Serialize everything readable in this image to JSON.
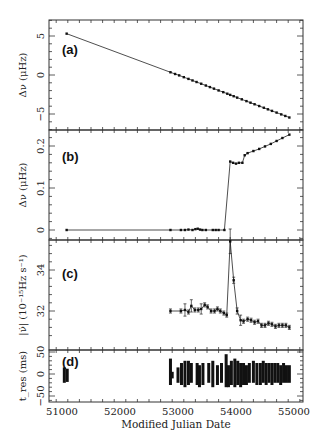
{
  "chart_data": [
    {
      "panel": "a",
      "type": "line",
      "panel_label": "(a)",
      "ylabel": "Δν (μHz)",
      "xlabel": "Modified Julian Date",
      "xlim": [
        50850,
        55150
      ],
      "ylim": [
        -7,
        7
      ],
      "yticks": [
        5,
        0,
        -5
      ],
      "ytick_labels": [
        "5",
        "0",
        "−5"
      ],
      "x": [
        51080,
        52870,
        52950,
        53020,
        53100,
        53180,
        53250,
        53320,
        53400,
        53480,
        53550,
        53620,
        53700,
        53780,
        53850,
        53900,
        53960,
        54020,
        54100,
        54180,
        54250,
        54320,
        54400,
        54480,
        54550,
        54620,
        54700,
        54780,
        54850,
        54920
      ],
      "y": [
        5.3,
        0.35,
        0.13,
        -0.05,
        -0.28,
        -0.5,
        -0.7,
        -0.9,
        -1.12,
        -1.35,
        -1.55,
        -1.75,
        -1.98,
        -2.2,
        -2.4,
        -2.55,
        -2.72,
        -2.9,
        -3.12,
        -3.35,
        -3.55,
        -3.75,
        -3.98,
        -4.2,
        -4.4,
        -4.6,
        -4.82,
        -5.05,
        -5.25,
        -5.45
      ]
    },
    {
      "panel": "b",
      "type": "line",
      "panel_label": "(b)",
      "ylabel": "Δν (μHz)",
      "xlim": [
        50850,
        55150
      ],
      "ylim": [
        -0.022,
        0.245
      ],
      "yticks": [
        0.2,
        0.1,
        0
      ],
      "ytick_labels": [
        "0.2",
        "0.1",
        "0"
      ],
      "x": [
        51080,
        52870,
        53050,
        53120,
        53180,
        53250,
        53300,
        53340,
        53380,
        53420,
        53480,
        53600,
        53650,
        53700,
        53800,
        53900,
        53950,
        54000,
        54050,
        54110,
        54150,
        54200,
        54300,
        54400,
        54500,
        54600,
        54700,
        54800,
        54920
      ],
      "y": [
        0.0,
        0.0,
        0.0,
        0.0,
        0.001,
        0.0,
        0.002,
        0.003,
        0.001,
        0.0,
        0.0,
        0.0,
        0.0,
        0.0,
        0.0,
        0.163,
        0.16,
        0.158,
        0.16,
        0.16,
        0.178,
        0.183,
        0.188,
        0.193,
        0.199,
        0.205,
        0.212,
        0.219,
        0.227
      ]
    },
    {
      "panel": "c",
      "type": "line",
      "panel_label": "(c)",
      "ylabel": "|ν̇| (10⁻¹⁵Hz s⁻¹)",
      "xlim": [
        50850,
        55150
      ],
      "ylim": [
        30.6,
        35.9
      ],
      "yticks": [
        34,
        32
      ],
      "ytick_labels": [
        "34",
        "32"
      ],
      "error_bars": true,
      "x": [
        52870,
        53050,
        53120,
        53180,
        53230,
        53290,
        53350,
        53400,
        53460,
        53510,
        53570,
        53630,
        53680,
        53730,
        53790,
        53840,
        53900,
        53960,
        54020,
        54080,
        54130,
        54200,
        54260,
        54320,
        54380,
        54440,
        54500,
        54560,
        54620,
        54680,
        54740,
        54800,
        54860,
        54920
      ],
      "y": [
        32.0,
        32.0,
        32.05,
        31.95,
        32.25,
        32.05,
        32.05,
        32.1,
        32.3,
        32.2,
        32.0,
        32.0,
        32.1,
        32.0,
        31.9,
        31.8,
        35.4,
        33.5,
        32.0,
        31.55,
        31.5,
        31.6,
        31.55,
        31.45,
        31.5,
        31.3,
        31.3,
        31.4,
        31.35,
        31.25,
        31.3,
        31.3,
        31.3,
        31.2
      ],
      "yerr": [
        0.1,
        0.1,
        0.3,
        0.1,
        0.3,
        0.1,
        0.1,
        0.25,
        0.1,
        0.1,
        0.1,
        0.1,
        0.1,
        0.1,
        0.1,
        0.1,
        0.6,
        0.15,
        0.15,
        0.25,
        0.1,
        0.1,
        0.1,
        0.1,
        0.1,
        0.1,
        0.1,
        0.1,
        0.1,
        0.1,
        0.1,
        0.1,
        0.1,
        0.1
      ]
    },
    {
      "panel": "d",
      "type": "scatter",
      "panel_label": "(d)",
      "ylabel": "t_res (ms)",
      "xlabel": "Modified Julian Date",
      "xlim": [
        50850,
        55150
      ],
      "ylim": [
        -62,
        62
      ],
      "yticks": [
        50,
        0,
        -50
      ],
      "ytick_labels": [
        "50",
        "0",
        "−50"
      ],
      "xticks": [
        51000,
        52000,
        53000,
        54000,
        55000
      ],
      "xtick_labels": [
        "51000",
        "52000",
        "53000",
        "54000",
        "55000"
      ],
      "columns": [
        {
          "x": 51040,
          "ymin": -20,
          "ymax": 15
        },
        {
          "x": 51090,
          "ymin": -18,
          "ymax": 12
        },
        {
          "x": 52870,
          "ymin": -25,
          "ymax": 35
        },
        {
          "x": 52900,
          "ymin": -10,
          "ymax": 5
        },
        {
          "x": 53000,
          "ymin": -20,
          "ymax": 15
        },
        {
          "x": 53060,
          "ymin": -25,
          "ymax": 25
        },
        {
          "x": 53120,
          "ymin": -30,
          "ymax": 30
        },
        {
          "x": 53180,
          "ymin": -25,
          "ymax": 30
        },
        {
          "x": 53230,
          "ymin": -20,
          "ymax": 25
        },
        {
          "x": 53330,
          "ymin": -25,
          "ymax": 25
        },
        {
          "x": 53370,
          "ymin": -30,
          "ymax": 20
        },
        {
          "x": 53430,
          "ymin": -25,
          "ymax": 25
        },
        {
          "x": 53530,
          "ymin": -20,
          "ymax": 25
        },
        {
          "x": 53600,
          "ymin": -30,
          "ymax": 30
        },
        {
          "x": 53680,
          "ymin": -25,
          "ymax": 20
        },
        {
          "x": 53750,
          "ymin": -20,
          "ymax": 25
        },
        {
          "x": 53830,
          "ymin": -30,
          "ymax": 45
        },
        {
          "x": 53870,
          "ymin": -30,
          "ymax": 20
        },
        {
          "x": 53920,
          "ymin": -25,
          "ymax": 30
        },
        {
          "x": 53980,
          "ymin": -30,
          "ymax": 35
        },
        {
          "x": 54030,
          "ymin": -25,
          "ymax": 30
        },
        {
          "x": 54080,
          "ymin": -30,
          "ymax": 25
        },
        {
          "x": 54130,
          "ymin": -25,
          "ymax": 25
        },
        {
          "x": 54180,
          "ymin": -25,
          "ymax": 20
        },
        {
          "x": 54230,
          "ymin": -20,
          "ymax": 25
        },
        {
          "x": 54300,
          "ymin": -20,
          "ymax": 30
        },
        {
          "x": 54360,
          "ymin": -25,
          "ymax": 25
        },
        {
          "x": 54420,
          "ymin": -25,
          "ymax": 25
        },
        {
          "x": 54470,
          "ymin": -20,
          "ymax": 30
        },
        {
          "x": 54520,
          "ymin": -25,
          "ymax": 25
        },
        {
          "x": 54570,
          "ymin": -20,
          "ymax": 25
        },
        {
          "x": 54620,
          "ymin": -25,
          "ymax": 25
        },
        {
          "x": 54670,
          "ymin": -20,
          "ymax": 25
        },
        {
          "x": 54720,
          "ymin": -20,
          "ymax": 25
        },
        {
          "x": 54770,
          "ymin": -25,
          "ymax": 20
        },
        {
          "x": 54820,
          "ymin": -20,
          "ymax": 25
        },
        {
          "x": 54870,
          "ymin": -20,
          "ymax": 20
        },
        {
          "x": 54920,
          "ymin": -20,
          "ymax": 20
        }
      ]
    }
  ],
  "figure": {
    "xlabel": "Modified Julian Date",
    "panels": {
      "a": {
        "label": "(a)",
        "ylabel": "Δν  (μHz)"
      },
      "b": {
        "label": "(b)",
        "ylabel": "Δν  (μHz)"
      },
      "c": {
        "label": "(c)",
        "ylabel": "|ν̇| (10⁻¹⁵Hz s⁻¹)"
      },
      "d": {
        "label": "(d)",
        "ylabel": "t_res (ms)"
      }
    }
  }
}
